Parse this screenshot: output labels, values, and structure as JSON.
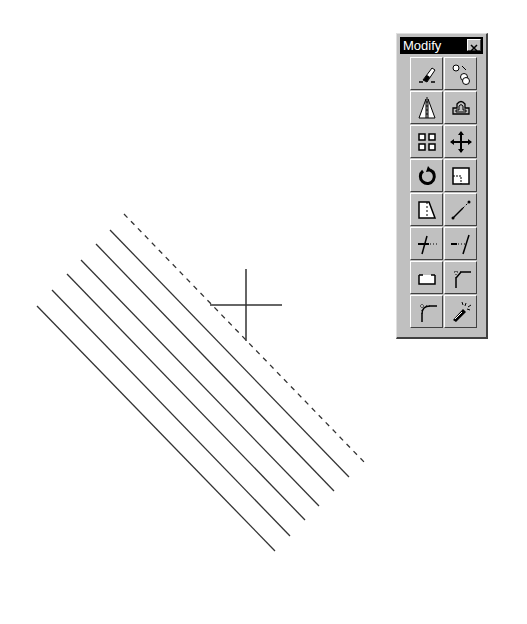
{
  "drawing": {
    "crosshair": {
      "x": 246,
      "y": 305,
      "size": 36
    },
    "lines": [
      {
        "x1": 124,
        "y1": 214,
        "x2": 365,
        "y2": 463,
        "style": "dashed"
      },
      {
        "x1": 110,
        "y1": 230,
        "x2": 349,
        "y2": 477,
        "style": "solid"
      },
      {
        "x1": 96,
        "y1": 244,
        "x2": 334,
        "y2": 491,
        "style": "solid"
      },
      {
        "x1": 81,
        "y1": 260,
        "x2": 319,
        "y2": 506,
        "style": "solid"
      },
      {
        "x1": 67,
        "y1": 274,
        "x2": 305,
        "y2": 520,
        "style": "solid"
      },
      {
        "x1": 52,
        "y1": 290,
        "x2": 290,
        "y2": 536,
        "style": "solid"
      },
      {
        "x1": 37,
        "y1": 306,
        "x2": 275,
        "y2": 551,
        "style": "solid"
      }
    ]
  },
  "toolbar": {
    "title": "Modify",
    "close_icon": "close-icon",
    "buttons": [
      {
        "name": "erase",
        "icon": "eraser-icon"
      },
      {
        "name": "copy",
        "icon": "copy-object-icon"
      },
      {
        "name": "mirror",
        "icon": "mirror-icon"
      },
      {
        "name": "offset",
        "icon": "offset-icon"
      },
      {
        "name": "array",
        "icon": "array-icon"
      },
      {
        "name": "move",
        "icon": "move-icon"
      },
      {
        "name": "rotate",
        "icon": "rotate-icon"
      },
      {
        "name": "scale",
        "icon": "scale-icon"
      },
      {
        "name": "stretch",
        "icon": "stretch-icon"
      },
      {
        "name": "lengthen",
        "icon": "lengthen-icon"
      },
      {
        "name": "trim",
        "icon": "trim-icon"
      },
      {
        "name": "extend",
        "icon": "extend-icon"
      },
      {
        "name": "break",
        "icon": "break-icon"
      },
      {
        "name": "chamfer",
        "icon": "chamfer-icon"
      },
      {
        "name": "fillet",
        "icon": "fillet-icon"
      },
      {
        "name": "explode",
        "icon": "explode-icon"
      }
    ]
  }
}
